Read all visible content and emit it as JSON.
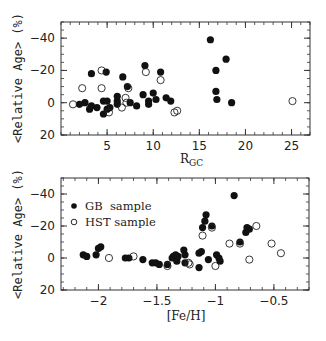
{
  "chart_data": [
    {
      "type": "scatter",
      "title": "",
      "xlabel": "R_gc",
      "ylabel": "<Relative Age> (%)",
      "xlim": [
        0,
        27
      ],
      "ylim": [
        20,
        -50
      ],
      "y_inverted": true,
      "xticks": [
        5,
        10,
        15,
        20,
        25
      ],
      "xtick_labels": [
        "5",
        "10",
        "15",
        "20",
        "25"
      ],
      "yticks": [
        -40,
        -20,
        0,
        20
      ],
      "ytick_labels": [
        "-40",
        "-20",
        "0",
        "20"
      ],
      "grid": false,
      "legend": null,
      "series": [
        {
          "name": "GB sample",
          "marker": "filled-circle",
          "points": [
            [
              2.0,
              1
            ],
            [
              2.6,
              0
            ],
            [
              3.1,
              4
            ],
            [
              3.3,
              2
            ],
            [
              3.3,
              -18
            ],
            [
              3.9,
              3
            ],
            [
              4.6,
              7
            ],
            [
              4.6,
              -1
            ],
            [
              4.9,
              -19
            ],
            [
              5.0,
              -1
            ],
            [
              5.0,
              4
            ],
            [
              5.3,
              3
            ],
            [
              6.1,
              -4
            ],
            [
              6.1,
              -1
            ],
            [
              6.1,
              1
            ],
            [
              6.7,
              -16
            ],
            [
              7.2,
              -10
            ],
            [
              7.5,
              0
            ],
            [
              8.2,
              2
            ],
            [
              8.9,
              -5
            ],
            [
              9.1,
              -23
            ],
            [
              9.5,
              -1
            ],
            [
              9.5,
              1
            ],
            [
              10.0,
              -6
            ],
            [
              10.3,
              -2
            ],
            [
              10.8,
              -19
            ],
            [
              11.4,
              -3
            ],
            [
              11.9,
              -1
            ],
            [
              16.2,
              -39
            ],
            [
              16.8,
              -20
            ],
            [
              16.8,
              -7
            ],
            [
              16.9,
              -2
            ],
            [
              17.9,
              -27
            ],
            [
              18.5,
              0
            ]
          ]
        },
        {
          "name": "HST sample",
          "marker": "open-circle",
          "points": [
            [
              1.3,
              1
            ],
            [
              2.3,
              -9
            ],
            [
              4.4,
              -20
            ],
            [
              4.4,
              -9
            ],
            [
              5.2,
              6
            ],
            [
              6.6,
              3
            ],
            [
              7.0,
              -3
            ],
            [
              7.1,
              0
            ],
            [
              7.3,
              -9
            ],
            [
              9.2,
              -19
            ],
            [
              10.8,
              -14
            ],
            [
              12.3,
              6
            ],
            [
              12.6,
              5
            ],
            [
              25.1,
              -1
            ]
          ]
        }
      ]
    },
    {
      "type": "scatter",
      "title": "",
      "xlabel": "[Fe/H]",
      "ylabel": "<Relative Age> (%)",
      "xlim": [
        -2.32,
        -0.2
      ],
      "ylim": [
        20,
        -50
      ],
      "y_inverted": true,
      "xticks": [
        -2,
        -1.5,
        -1,
        -0.5
      ],
      "xtick_labels": [
        "-2",
        "-1.5",
        "-1",
        "-0.5"
      ],
      "yticks": [
        -40,
        -20,
        0,
        20
      ],
      "ytick_labels": [
        "-40",
        "-20",
        "0",
        "20"
      ],
      "grid": false,
      "legend": {
        "position": "upper-left",
        "entries": [
          "GB  sample",
          "HST sample"
        ]
      },
      "series": [
        {
          "name": "GB sample",
          "marker": "filled-circle",
          "points": [
            [
              -2.13,
              -2
            ],
            [
              -2.1,
              -1
            ],
            [
              -2.02,
              -2
            ],
            [
              -2.0,
              -6
            ],
            [
              -1.98,
              -7
            ],
            [
              -1.77,
              0
            ],
            [
              -1.74,
              0
            ],
            [
              -1.62,
              1
            ],
            [
              -1.54,
              3
            ],
            [
              -1.51,
              3
            ],
            [
              -1.48,
              4
            ],
            [
              -1.41,
              4
            ],
            [
              -1.37,
              0
            ],
            [
              -1.36,
              -1
            ],
            [
              -1.34,
              -2
            ],
            [
              -1.33,
              2
            ],
            [
              -1.32,
              -1
            ],
            [
              -1.27,
              -5
            ],
            [
              -1.26,
              -2
            ],
            [
              -1.26,
              3
            ],
            [
              -1.14,
              -3
            ],
            [
              -1.14,
              6
            ],
            [
              -1.12,
              -4
            ],
            [
              -1.11,
              -19
            ],
            [
              -1.09,
              -23
            ],
            [
              -1.08,
              -27
            ],
            [
              -1.06,
              1
            ],
            [
              -1.03,
              -20
            ],
            [
              -0.99,
              -2
            ],
            [
              -0.97,
              0
            ],
            [
              -0.96,
              2
            ],
            [
              -0.84,
              -39
            ],
            [
              -0.79,
              -10
            ],
            [
              -0.74,
              -16
            ],
            [
              -0.73,
              -19
            ],
            [
              -0.71,
              -18
            ]
          ]
        },
        {
          "name": "HST sample",
          "marker": "open-circle",
          "points": [
            [
              -1.91,
              0
            ],
            [
              -1.7,
              -1
            ],
            [
              -1.41,
              5
            ],
            [
              -1.23,
              3
            ],
            [
              -1.22,
              4
            ],
            [
              -1.11,
              -14
            ],
            [
              -1.03,
              -19
            ],
            [
              -1.0,
              5
            ],
            [
              -0.88,
              -9
            ],
            [
              -0.79,
              -9
            ],
            [
              -0.71,
              1
            ],
            [
              -0.65,
              -20
            ],
            [
              -0.52,
              -9
            ],
            [
              -0.44,
              -3
            ]
          ]
        }
      ]
    }
  ],
  "labels": {
    "top_ylabel": "<Relative Age> (%)",
    "top_xlabel_main": "R",
    "top_xlabel_sub": "GC",
    "bottom_ylabel": "<Relative Age> (%)",
    "bottom_xlabel": "[Fe/H]",
    "legend_gb": "GB  sample",
    "legend_hst": "HST sample"
  }
}
